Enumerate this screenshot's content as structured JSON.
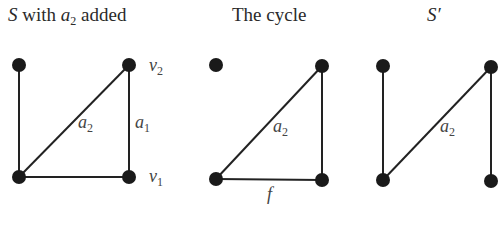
{
  "panels": [
    {
      "title_html": "<i>S</i> with <i>a</i><sub>2</sub> added",
      "title_text": "S with a2 added",
      "nodes": [
        [
          19,
          65
        ],
        [
          129,
          65
        ],
        [
          19,
          177
        ],
        [
          129,
          177
        ]
      ],
      "edges": [
        [
          0,
          2
        ],
        [
          2,
          1
        ],
        [
          1,
          3
        ],
        [
          2,
          3
        ]
      ],
      "labels": [
        {
          "text": "a2",
          "x": 86,
          "y": 114
        },
        {
          "text": "a1",
          "x": 136,
          "y": 114
        },
        {
          "text": "v2",
          "x": 148,
          "y": 56
        },
        {
          "text": "v1",
          "x": 148,
          "y": 168
        }
      ]
    },
    {
      "title_text": "The cycle",
      "nodes": [
        [
          216,
          65
        ],
        [
          322,
          66
        ],
        [
          216,
          179
        ],
        [
          322,
          180
        ]
      ],
      "edges": [
        [
          2,
          1
        ],
        [
          1,
          3
        ],
        [
          2,
          3
        ]
      ],
      "labels": [
        {
          "text": "a2",
          "x": 273,
          "y": 116
        },
        {
          "text": "f",
          "x": 268,
          "y": 186
        }
      ]
    },
    {
      "title_text": "S′",
      "nodes": [
        [
          383,
          66
        ],
        [
          491,
          67
        ],
        [
          383,
          180
        ],
        [
          491,
          181
        ]
      ],
      "edges": [
        [
          0,
          2
        ],
        [
          2,
          1
        ],
        [
          1,
          3
        ]
      ],
      "labels": [
        {
          "text": "a2",
          "x": 440,
          "y": 116
        }
      ]
    }
  ],
  "titles": {
    "p1": "S with a2 added",
    "p2": "The cycle",
    "p3": "S′"
  }
}
